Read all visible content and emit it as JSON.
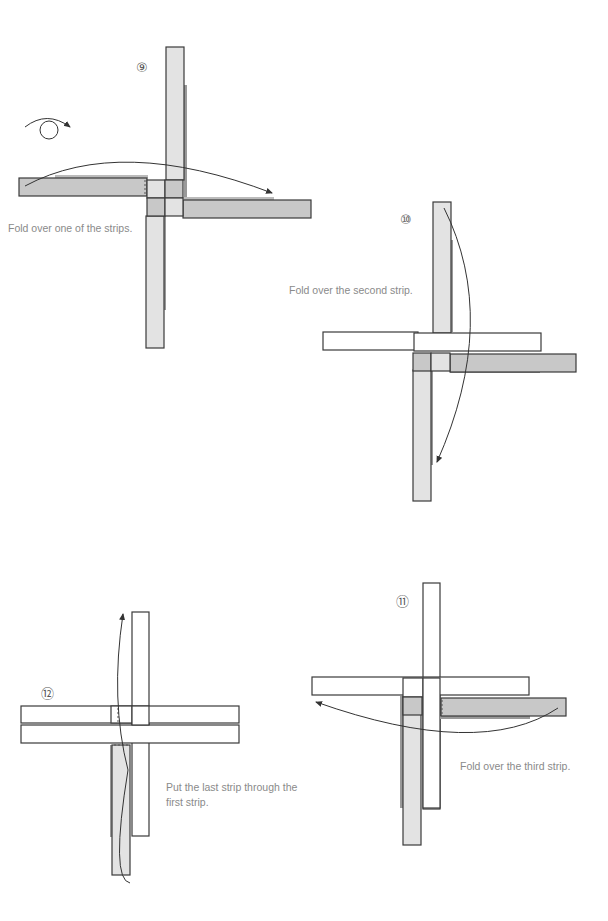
{
  "colors": {
    "strip_light": "#e3e3e3",
    "strip_dark": "#c8c8c8",
    "strip_white": "#ffffff",
    "outline": "#3a3a3a",
    "caption_text": "#8a8a8a"
  },
  "steps": [
    {
      "number": "⑨",
      "caption": "Fold over one of the strips.",
      "icon": "turn-over-icon"
    },
    {
      "number": "⑩",
      "caption": "Fold over the second strip."
    },
    {
      "number": "⑪",
      "caption": "Fold over the third strip."
    },
    {
      "number": "⑫",
      "caption_line1": "Put the last strip through the",
      "caption_line2": "first strip."
    }
  ]
}
